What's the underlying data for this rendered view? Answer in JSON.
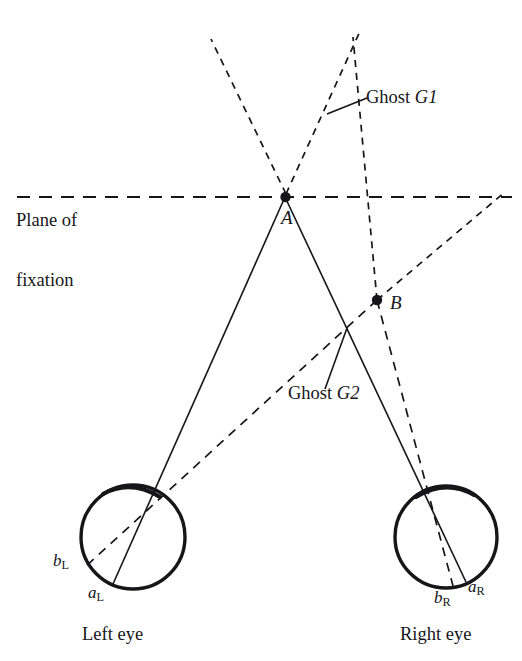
{
  "figure": {
    "type": "optical-geometry-diagram",
    "title_visible": false,
    "background_color": "#ffffff",
    "stroke_color": "#16161a",
    "width": 522,
    "height": 661
  },
  "labels": {
    "plane_line1": "Plane of",
    "plane_line2": "fixation",
    "ghost1": "Ghost G1",
    "ghost1_name": "Ghost",
    "ghost1_id": "G1",
    "ghost2": "Ghost G2",
    "ghost2_name": "Ghost",
    "ghost2_id": "G2",
    "point_a": "A",
    "point_b": "B",
    "left_eye": "Left eye",
    "right_eye": "Right eye",
    "a_left_base": "a",
    "a_left_sub": "L",
    "b_left_base": "b",
    "b_left_sub": "L",
    "a_right_base": "a",
    "a_right_sub": "R",
    "b_right_base": "b",
    "b_right_sub": "R"
  },
  "geometry": {
    "plane_of_fixation": {
      "y": 197,
      "x_start": 17,
      "x_end": 512,
      "style": "dashed"
    },
    "point_A": {
      "x": 285,
      "y": 197
    },
    "point_B": {
      "x": 377,
      "y": 300
    },
    "ghost_G1_intersection": {
      "x": 325,
      "y": 115
    },
    "ghost_G2_intersection": {
      "x": 347,
      "y": 328
    },
    "left_eye": {
      "cx": 133,
      "cy": 537,
      "r": 52,
      "node_x": 152,
      "node_y": 488
    },
    "right_eye": {
      "cx": 446,
      "cy": 537,
      "r": 51,
      "node_x": 424,
      "node_y": 488
    },
    "retina_points": {
      "a_L": {
        "x": 113,
        "y": 583
      },
      "b_L": {
        "x": 84,
        "y": 567
      },
      "a_R": {
        "x": 466,
        "y": 581
      },
      "b_R": {
        "x": 454,
        "y": 584
      }
    },
    "solid_rays": [
      {
        "name": "A-to-left-eye",
        "from": [
          285,
          197
        ],
        "to": [
          113,
          583
        ]
      },
      {
        "name": "A-to-right-eye",
        "from": [
          285,
          197
        ],
        "to": [
          466,
          581
        ]
      }
    ],
    "dashed_rays": [
      {
        "name": "B-to-left-eye",
        "from": [
          377,
          300
        ],
        "to": [
          84,
          567
        ]
      },
      {
        "name": "B-to-right-eye",
        "from": [
          377,
          300
        ],
        "to": [
          454,
          584
        ]
      }
    ],
    "ghost_rays": [
      {
        "name": "left-eye-through-A-upward",
        "from": [
          285,
          197
        ],
        "to": [
          212,
          40
        ]
      },
      {
        "name": "right-eye-through-A-upward",
        "from": [
          285,
          197
        ],
        "to": [
          360,
          30
        ]
      },
      {
        "name": "ghost-ray-through-B-upward",
        "from": [
          377,
          300
        ],
        "to": [
          354,
          38
        ]
      },
      {
        "name": "left-eye-through-B-extended-right",
        "from": [
          377,
          300
        ],
        "to": [
          500,
          195
        ]
      }
    ],
    "leader_lines": [
      {
        "name": "ghost1-leader",
        "from": [
          328,
          113
        ],
        "to": [
          366,
          98
        ]
      },
      {
        "name": "ghost2-leader",
        "from": [
          347,
          329
        ],
        "to": [
          325,
          390
        ]
      }
    ]
  }
}
